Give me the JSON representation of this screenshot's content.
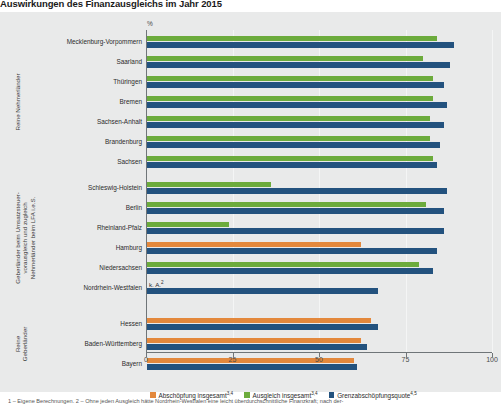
{
  "title": "Auswirkungen des Finanzausgleichs im Jahr 2015",
  "axis": {
    "unit": "%",
    "ticks": [
      0,
      25,
      50,
      75,
      100
    ]
  },
  "groups": [
    {
      "caption": "Reine Nehmerländer",
      "states": [
        "Mecklenburg-Vorpommern",
        "Saarland",
        "Thüringen",
        "Bremen",
        "Sachsen-Anhalt",
        "Brandenburg",
        "Sachsen"
      ]
    },
    {
      "caption": "Geberländer beim Umsatzsteuer-\nvorausgleich und zugleich\nNehmerländer beim LFA i.e.S.",
      "states": [
        "Schleswig-Holstein",
        "Berlin",
        "Rheinland-Pfalz",
        "Hamburg",
        "Niedersachsen",
        "Nordrhein-Westfalen"
      ]
    },
    {
      "caption": "Reine\nGeberländer",
      "states": [
        "Hessen",
        "Baden-Württemberg",
        "Bayern"
      ]
    }
  ],
  "annotations": [
    {
      "text": "k. A.",
      "sup": "2",
      "category": "Nordrhein-Westfalen"
    }
  ],
  "legend": [
    {
      "label": "Abschöpfung insgesamt",
      "sup": "3,4",
      "color": "#e3883c",
      "key": "abschoepfung"
    },
    {
      "label": "Ausgleich insgesamt",
      "sup": "3,4",
      "color": "#6cab3c",
      "key": "ausgleich"
    },
    {
      "label": "Grenzabschöpfungsquote",
      "sup": "4,5",
      "color": "#23527e",
      "key": "grenzquote"
    }
  ],
  "footnote": "1 – Eigene Berechnungen. 2 – Ohne jeden Ausgleich hätte Nordrhein-Westfalen eine leicht überdurchschnittliche Finanzkraft; nach der-",
  "colors": {
    "abschoepfung": "#e3883c",
    "ausgleich": "#6cab3c",
    "grenzquote": "#23527e",
    "panel_bg": "#e9eaea",
    "axis": "#6f7578"
  },
  "chart_data": {
    "type": "bar",
    "orientation": "horizontal",
    "title": "Auswirkungen des Finanzausgleichs im Jahr 2015",
    "xlabel": "%",
    "ylabel": "",
    "xlim": [
      0,
      100
    ],
    "grid": true,
    "legend_position": "bottom",
    "categories": [
      "Mecklenburg-Vorpommern",
      "Saarland",
      "Thüringen",
      "Bremen",
      "Sachsen-Anhalt",
      "Brandenburg",
      "Sachsen",
      "Schleswig-Holstein",
      "Berlin",
      "Rheinland-Pfalz",
      "Hamburg",
      "Niedersachsen",
      "Nordrhein-Westfalen",
      "Hessen",
      "Baden-Württemberg",
      "Bayern"
    ],
    "series": [
      {
        "name": "Abschöpfung insgesamt",
        "color": "#e3883c",
        "values": [
          null,
          null,
          null,
          null,
          null,
          null,
          null,
          null,
          null,
          null,
          62,
          null,
          null,
          65,
          62,
          60
        ]
      },
      {
        "name": "Ausgleich insgesamt",
        "color": "#6cab3c",
        "values": [
          84,
          80,
          83,
          83,
          82,
          82,
          83,
          36,
          81,
          24,
          null,
          79,
          null,
          null,
          null,
          null
        ]
      },
      {
        "name": "Grenzabschöpfungsquote",
        "color": "#23527e",
        "values": [
          89,
          88,
          86,
          87,
          86,
          85,
          84,
          87,
          86,
          86,
          84,
          83,
          67,
          67,
          64,
          61
        ]
      }
    ],
    "annotations": [
      {
        "category": "Nordrhein-Westfalen",
        "series": "Abschöpfung/Ausgleich insgesamt",
        "text": "k. A.2"
      }
    ]
  }
}
